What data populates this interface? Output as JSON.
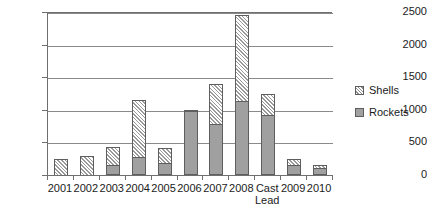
{
  "chart_data": {
    "type": "bar",
    "subtype": "stacked-bar",
    "title": "",
    "xlabel": "",
    "ylabel": "",
    "ylim": [
      0,
      2500
    ],
    "yticks": [
      0,
      500,
      1000,
      1500,
      2000,
      2500
    ],
    "ytick_labels": [
      "0",
      "500",
      "1000",
      "1500",
      "2000",
      "2500"
    ],
    "grid": true,
    "legend_position": "right",
    "categories": [
      "2001",
      "2002",
      "2003",
      "2004",
      "2005",
      "2006",
      "2007",
      "2008",
      "Cast\nLead",
      "2009",
      "2010"
    ],
    "category_labels": [
      "2001",
      "2002",
      "2003",
      "2004",
      "2005",
      "2006",
      "2007",
      "2008",
      "Cast Lead",
      "2009",
      "2010"
    ],
    "series": [
      {
        "name": "Rockets",
        "style": "solid-gray",
        "color": "#a0a0a0",
        "values": [
          0,
          0,
          155,
          281,
          179,
          975,
          780,
          1139,
          925,
          160,
          110
        ]
      },
      {
        "name": "Shells",
        "style": "diagonal-hatch",
        "color": "#ffffff",
        "values": [
          245,
          290,
          270,
          870,
          230,
          15,
          620,
          1310,
          315,
          90,
          50
        ]
      }
    ],
    "totals": [
      245,
      290,
      425,
      1151,
      409,
      990,
      1400,
      2449,
      1240,
      250,
      160
    ]
  },
  "legend": {
    "entries": [
      {
        "label": "Shells",
        "swatch": "shells"
      },
      {
        "label": "Rockets",
        "swatch": "rockets"
      }
    ]
  },
  "colors": {
    "axis": "#6f6f6f",
    "grid": "#8a8a8a",
    "bar_outline": "#5e5e5e",
    "rockets_fill": "#a0a0a0",
    "text": "#1b1b1b",
    "background": "#ffffff"
  }
}
